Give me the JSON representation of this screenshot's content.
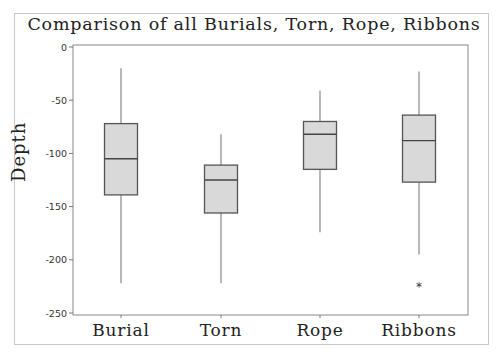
{
  "chart_data": {
    "type": "box",
    "title": "Comparison of all Burials, Torn, Rope, Ribbons",
    "xlabel": "",
    "ylabel": "Depth",
    "ylim": [
      -250,
      0
    ],
    "yticks": [
      0,
      -50,
      -100,
      -150,
      -200,
      -250
    ],
    "ytick_labels": [
      "0",
      "-50",
      "-100",
      "-150",
      "-200",
      "-250"
    ],
    "categories": [
      "Burial",
      "Torn",
      "Rope",
      "Ribbons"
    ],
    "series": [
      {
        "name": "Burial",
        "whisker_high": -20,
        "q3": -72,
        "median": -105,
        "q1": -139,
        "whisker_low": -222,
        "outliers": []
      },
      {
        "name": "Torn",
        "whisker_high": -82,
        "q3": -111,
        "median": -125,
        "q1": -156,
        "whisker_low": -222,
        "outliers": []
      },
      {
        "name": "Rope",
        "whisker_high": -41,
        "q3": -70,
        "median": -82,
        "q1": -115,
        "whisker_low": -174,
        "outliers": []
      },
      {
        "name": "Ribbons",
        "whisker_high": -23,
        "q3": -64,
        "median": -88,
        "q1": -127,
        "whisker_low": -195,
        "outliers": [
          -225
        ]
      }
    ],
    "grid": false,
    "legend": null,
    "colors": {
      "box_fill": "#d9d9d9",
      "box_edge": "#555555",
      "whisker": "#888888",
      "median": "#444444"
    }
  }
}
